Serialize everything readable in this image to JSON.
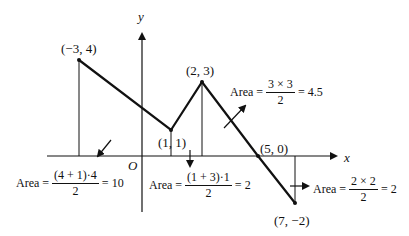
{
  "axes": {
    "x_label": "x",
    "y_label": "y",
    "origin_label": "O"
  },
  "points": [
    {
      "label": "(−3, 4)",
      "x": -3,
      "y": 4
    },
    {
      "label": "(1, 1)",
      "x": 1,
      "y": 1
    },
    {
      "label": "(2, 3)",
      "x": 2,
      "y": 3
    },
    {
      "label": "(5, 0)",
      "x": 5,
      "y": 0
    },
    {
      "label": "(7, −2)",
      "x": 7,
      "y": -2
    }
  ],
  "areas": [
    {
      "prefix": "Area =",
      "numerator": "(4 + 1)·4",
      "denominator": "2",
      "result": "= 10"
    },
    {
      "prefix": "Area =",
      "numerator": "(1 + 3)·1",
      "denominator": "2",
      "result": "= 2"
    },
    {
      "prefix": "Area =",
      "numerator": "3 × 3",
      "denominator": "2",
      "result": "= 4.5"
    },
    {
      "prefix": "Area =",
      "numerator": "2 × 2",
      "denominator": "2",
      "result": "= 2"
    }
  ],
  "colors": {
    "line": "#111111",
    "background": "#ffffff"
  }
}
